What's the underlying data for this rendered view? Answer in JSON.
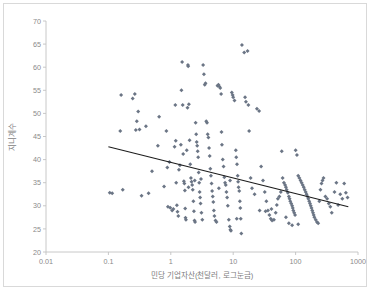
{
  "chart_data": {
    "type": "scatter",
    "title": "",
    "xlabel": "민당 기업자산(천달러, 로그눈금)",
    "ylabel": "지니계수",
    "xscale": "log",
    "xlim": [
      0.01,
      1000
    ],
    "ylim": [
      20,
      70
    ],
    "xticks": [
      "0.01",
      "0.1",
      "1",
      "10",
      "100",
      "1000"
    ],
    "xtick_values": [
      0.01,
      0.1,
      1,
      10,
      100,
      1000
    ],
    "yticks": [
      "20",
      "25",
      "30",
      "35",
      "40",
      "45",
      "50",
      "55",
      "60",
      "65",
      "70"
    ],
    "ytick_values": [
      20,
      25,
      30,
      35,
      40,
      45,
      50,
      55,
      60,
      65,
      70
    ],
    "grid": false,
    "legend": false,
    "marker": "diamond",
    "marker_color": "#6b7585",
    "trendline": {
      "color": "#1b1b1b",
      "x_start": 0.1,
      "y_start": 42.8,
      "x_end": 700,
      "y_end": 29.8
    },
    "series": [
      {
        "name": "국가",
        "points": [
          [
            0.105,
            32.8
          ],
          [
            0.16,
            54.0
          ],
          [
            0.155,
            46.2
          ],
          [
            0.17,
            33.5
          ],
          [
            0.245,
            53.2
          ],
          [
            0.265,
            54.2
          ],
          [
            0.275,
            46.4
          ],
          [
            0.285,
            48.3
          ],
          [
            0.3,
            50.4
          ],
          [
            0.315,
            46.5
          ],
          [
            0.34,
            32.2
          ],
          [
            0.4,
            47.2
          ],
          [
            0.44,
            32.7
          ],
          [
            0.5,
            37.5
          ],
          [
            0.62,
            43.0
          ],
          [
            0.65,
            49.3
          ],
          [
            0.78,
            34.2
          ],
          [
            0.85,
            46.2
          ],
          [
            0.88,
            38.3
          ],
          [
            0.9,
            29.8
          ],
          [
            0.95,
            39.5
          ],
          [
            0.98,
            29.6
          ],
          [
            1.05,
            29.0
          ],
          [
            1.1,
            29.3
          ],
          [
            1.15,
            42.8
          ],
          [
            1.18,
            51.8
          ],
          [
            1.2,
            44.1
          ],
          [
            1.22,
            35.0
          ],
          [
            1.25,
            30.1
          ],
          [
            1.28,
            28.7
          ],
          [
            1.32,
            27.8
          ],
          [
            1.35,
            37.8
          ],
          [
            1.4,
            38.8
          ],
          [
            1.45,
            43.2
          ],
          [
            1.48,
            55.0
          ],
          [
            1.52,
            61.1
          ],
          [
            1.55,
            51.8
          ],
          [
            1.58,
            41.2
          ],
          [
            1.62,
            35.3
          ],
          [
            1.65,
            34.8
          ],
          [
            1.68,
            33.3
          ],
          [
            1.7,
            29.4
          ],
          [
            1.72,
            27.4
          ],
          [
            1.75,
            27.0
          ],
          [
            1.8,
            42.0
          ],
          [
            1.85,
            51.2
          ],
          [
            1.88,
            60.5
          ],
          [
            1.9,
            60.2
          ],
          [
            1.95,
            52.0
          ],
          [
            2.0,
            44.2
          ],
          [
            2.05,
            39.0
          ],
          [
            2.1,
            36.0
          ],
          [
            2.15,
            35.2
          ],
          [
            2.2,
            34.5
          ],
          [
            2.25,
            33.5
          ],
          [
            2.3,
            31.0
          ],
          [
            2.35,
            28.8
          ],
          [
            2.4,
            26.8
          ],
          [
            2.45,
            26.5
          ],
          [
            2.5,
            48.0
          ],
          [
            2.55,
            45.5
          ],
          [
            2.6,
            43.8
          ],
          [
            2.65,
            43.0
          ],
          [
            2.7,
            41.8
          ],
          [
            2.75,
            40.5
          ],
          [
            2.8,
            37.2
          ],
          [
            2.85,
            35.0
          ],
          [
            2.9,
            33.0
          ],
          [
            2.95,
            31.8
          ],
          [
            3.0,
            30.5
          ],
          [
            3.1,
            28.5
          ],
          [
            3.2,
            27.0
          ],
          [
            3.3,
            60.5
          ],
          [
            3.4,
            58.5
          ],
          [
            3.5,
            56.2
          ],
          [
            3.6,
            56.5
          ],
          [
            3.7,
            48.3
          ],
          [
            3.8,
            48.0
          ],
          [
            3.9,
            45.5
          ],
          [
            4.0,
            44.8
          ],
          [
            4.1,
            42.5
          ],
          [
            4.2,
            40.8
          ],
          [
            4.3,
            38.0
          ],
          [
            4.4,
            36.5
          ],
          [
            4.5,
            34.8
          ],
          [
            4.6,
            33.2
          ],
          [
            4.7,
            32.0
          ],
          [
            4.8,
            30.8
          ],
          [
            4.9,
            29.0
          ],
          [
            5.0,
            27.8
          ],
          [
            5.2,
            26.8
          ],
          [
            5.4,
            26.5
          ],
          [
            5.6,
            56.0
          ],
          [
            5.8,
            56.2
          ],
          [
            6.0,
            55.8
          ],
          [
            6.2,
            55.5
          ],
          [
            6.4,
            54.2
          ],
          [
            6.5,
            46.0
          ],
          [
            6.6,
            43.2
          ],
          [
            6.8,
            40.0
          ],
          [
            7.0,
            38.5
          ],
          [
            7.2,
            36.2
          ],
          [
            7.4,
            35.0
          ],
          [
            7.6,
            34.5
          ],
          [
            7.8,
            33.0
          ],
          [
            8.0,
            31.8
          ],
          [
            8.2,
            30.0
          ],
          [
            8.5,
            27.0
          ],
          [
            8.8,
            25.5
          ],
          [
            9.0,
            24.8
          ],
          [
            9.2,
            24.6
          ],
          [
            9.5,
            54.5
          ],
          [
            9.8,
            54.0
          ],
          [
            10.0,
            53.5
          ],
          [
            10.5,
            52.8
          ],
          [
            11.0,
            42.0
          ],
          [
            11.2,
            40.5
          ],
          [
            11.5,
            39.0
          ],
          [
            11.8,
            36.5
          ],
          [
            12.0,
            35.2
          ],
          [
            12.2,
            34.0
          ],
          [
            12.5,
            33.2
          ],
          [
            12.8,
            31.0
          ],
          [
            13.0,
            29.5
          ],
          [
            13.2,
            27.2
          ],
          [
            13.5,
            24.0
          ],
          [
            13.8,
            64.8
          ],
          [
            15.0,
            63.2
          ],
          [
            17.0,
            63.5
          ],
          [
            15.5,
            53.5
          ],
          [
            16.0,
            52.5
          ],
          [
            17.5,
            51.8
          ],
          [
            18.0,
            46.2
          ],
          [
            19.0,
            36.0
          ],
          [
            20.0,
            33.8
          ],
          [
            22.0,
            32.5
          ],
          [
            24.0,
            51.0
          ],
          [
            26.0,
            50.5
          ],
          [
            28.0,
            38.5
          ],
          [
            30.0,
            35.5
          ],
          [
            32.0,
            33.0
          ],
          [
            34.0,
            31.0
          ],
          [
            36.0,
            29.0
          ],
          [
            38.0,
            28.0
          ],
          [
            40.0,
            27.2
          ],
          [
            42.0,
            26.8
          ],
          [
            45.0,
            27.0
          ],
          [
            48.0,
            28.5
          ],
          [
            50.0,
            30.2
          ],
          [
            52.0,
            31.5
          ],
          [
            55.0,
            32.0
          ],
          [
            58.0,
            33.0
          ],
          [
            60.0,
            41.8
          ],
          [
            62.0,
            36.0
          ],
          [
            65.0,
            35.0
          ],
          [
            68.0,
            34.5
          ],
          [
            70.0,
            34.0
          ],
          [
            72.0,
            33.5
          ],
          [
            75.0,
            32.8
          ],
          [
            78.0,
            32.0
          ],
          [
            80.0,
            31.5
          ],
          [
            82.0,
            31.0
          ],
          [
            85.0,
            30.5
          ],
          [
            88.0,
            30.0
          ],
          [
            90.0,
            29.5
          ],
          [
            92.0,
            29.0
          ],
          [
            95.0,
            28.5
          ],
          [
            98.0,
            28.0
          ],
          [
            100.0,
            42.0
          ],
          [
            105.0,
            41.0
          ],
          [
            110.0,
            36.5
          ],
          [
            115.0,
            36.0
          ],
          [
            120.0,
            35.5
          ],
          [
            125.0,
            35.0
          ],
          [
            130.0,
            34.5
          ],
          [
            135.0,
            34.0
          ],
          [
            140.0,
            33.5
          ],
          [
            145.0,
            33.0
          ],
          [
            150.0,
            32.5
          ],
          [
            155.0,
            32.0
          ],
          [
            160.0,
            31.5
          ],
          [
            165.0,
            31.0
          ],
          [
            170.0,
            30.5
          ],
          [
            175.0,
            30.0
          ],
          [
            180.0,
            29.5
          ],
          [
            185.0,
            29.0
          ],
          [
            190.0,
            28.5
          ],
          [
            195.0,
            28.0
          ],
          [
            200.0,
            27.5
          ],
          [
            210.0,
            27.0
          ],
          [
            220.0,
            26.5
          ],
          [
            230.0,
            26.2
          ],
          [
            240.0,
            31.0
          ],
          [
            250.0,
            33.5
          ],
          [
            260.0,
            34.8
          ],
          [
            270.0,
            35.5
          ],
          [
            280.0,
            36.0
          ],
          [
            300.0,
            32.0
          ],
          [
            320.0,
            31.5
          ],
          [
            340.0,
            30.5
          ],
          [
            360.0,
            29.8
          ],
          [
            380.0,
            28.5
          ],
          [
            420.0,
            33.0
          ],
          [
            450.0,
            35.0
          ],
          [
            480.0,
            30.2
          ],
          [
            520.0,
            32.5
          ],
          [
            560.0,
            31.5
          ],
          [
            600.0,
            34.8
          ],
          [
            640.0,
            32.8
          ],
          [
            680.0,
            31.8
          ],
          [
            110.0,
            26.0
          ],
          [
            88.0,
            25.8
          ],
          [
            78.0,
            26.2
          ],
          [
            70.0,
            27.5
          ],
          [
            0.115,
            32.7
          ],
          [
            1.92,
            34.0
          ],
          [
            2.42,
            35.5
          ],
          [
            3.05,
            35.8
          ],
          [
            5.9,
            33.8
          ],
          [
            8.9,
            35.5
          ],
          [
            11.4,
            27.2
          ],
          [
            26.5,
            29.0
          ],
          [
            33.0,
            28.8
          ],
          [
            41.0,
            29.3
          ]
        ]
      }
    ]
  }
}
